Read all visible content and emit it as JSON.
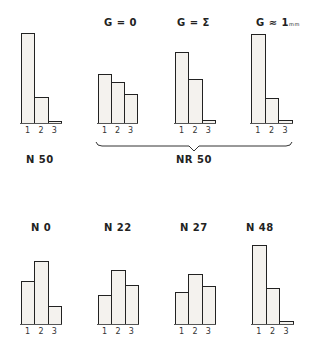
{
  "figure": {
    "top_labels": {
      "g0": "G = 0",
      "gsigma": "G = Σ",
      "g1mm": "G ≈ 1",
      "g1mm_unit": "mm"
    },
    "bottom_labels": {
      "n50": "N 50",
      "nr50": "NR 50",
      "n0": "N 0",
      "n22": "N 22",
      "n27": "N 27",
      "n48": "N 48"
    },
    "tick_labels": [
      "1",
      "2",
      "3"
    ]
  },
  "chart_data": [
    {
      "type": "bar",
      "title": "N 50",
      "categories": [
        "1",
        "2",
        "3"
      ],
      "values": [
        91,
        27,
        3
      ],
      "row": "top",
      "group": ""
    },
    {
      "type": "bar",
      "title": "G = 0",
      "categories": [
        "1",
        "2",
        "3"
      ],
      "values": [
        50,
        42,
        30
      ],
      "row": "top",
      "group": "NR 50"
    },
    {
      "type": "bar",
      "title": "G = Σ",
      "categories": [
        "1",
        "2",
        "3"
      ],
      "values": [
        72,
        45,
        4
      ],
      "row": "top",
      "group": "NR 50"
    },
    {
      "type": "bar",
      "title": "G ≈ 1mm",
      "categories": [
        "1",
        "2",
        "3"
      ],
      "values": [
        90,
        26,
        4
      ],
      "row": "top",
      "group": "NR 50"
    },
    {
      "type": "bar",
      "title": "N 0",
      "categories": [
        "1",
        "2",
        "3"
      ],
      "values": [
        44,
        64,
        19
      ],
      "row": "bottom"
    },
    {
      "type": "bar",
      "title": "N 22",
      "categories": [
        "1",
        "2",
        "3"
      ],
      "values": [
        30,
        55,
        40
      ],
      "row": "bottom"
    },
    {
      "type": "bar",
      "title": "N 27",
      "categories": [
        "1",
        "2",
        "3"
      ],
      "values": [
        33,
        51,
        39
      ],
      "row": "bottom"
    },
    {
      "type": "bar",
      "title": "N 48",
      "categories": [
        "1",
        "2",
        "3"
      ],
      "values": [
        80,
        37,
        4
      ],
      "row": "bottom"
    }
  ]
}
